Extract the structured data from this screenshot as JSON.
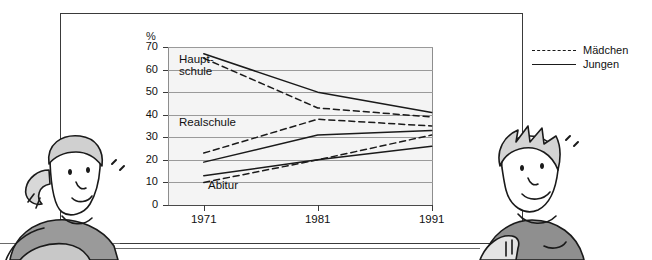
{
  "legend": {
    "items": [
      {
        "label": "Mädchen",
        "style": "dashed",
        "name": "legend-maedchen"
      },
      {
        "label": "Jungen",
        "style": "solid",
        "name": "legend-jungen"
      }
    ]
  },
  "captions": {
    "hauptschule_line1": "Haupt-",
    "hauptschule_line2": "schule",
    "realschule": "Realschule",
    "abitur": "Abitur"
  },
  "figures": {
    "girl_alt": "cartoon-girl-illustration",
    "boy_alt": "cartoon-boy-illustration"
  },
  "chart_data": {
    "type": "line",
    "title": "",
    "xlabel": "",
    "ylabel": "%",
    "unit_label": "%",
    "x": [
      1971,
      1981,
      1991
    ],
    "categories": [
      "1971",
      "1981",
      "1991"
    ],
    "xtick_labels": [
      "1971",
      "1981",
      "1991"
    ],
    "ytick_labels": [
      "0",
      "10",
      "20",
      "30",
      "40",
      "50",
      "60",
      "70"
    ],
    "yticks": [
      0,
      10,
      20,
      30,
      40,
      50,
      60,
      70
    ],
    "ylim": [
      0,
      70
    ],
    "grid": true,
    "legend_position": "outside-right",
    "annotations": [
      "Haupt-schule",
      "Realschule",
      "Abitur"
    ],
    "series": [
      {
        "name": "Hauptschule Jungen",
        "group": "Hauptschule",
        "gender": "Jungen",
        "style": "solid",
        "values": [
          67,
          50,
          41
        ]
      },
      {
        "name": "Hauptschule Mädchen",
        "group": "Hauptschule",
        "gender": "Mädchen",
        "style": "dashed",
        "values": [
          65,
          43,
          39
        ]
      },
      {
        "name": "Realschule Mädchen",
        "group": "Realschule",
        "gender": "Mädchen",
        "style": "dashed",
        "values": [
          23,
          38,
          35
        ]
      },
      {
        "name": "Realschule Jungen",
        "group": "Realschule",
        "gender": "Jungen",
        "style": "solid",
        "values": [
          19,
          31,
          33
        ]
      },
      {
        "name": "Abitur Jungen",
        "group": "Abitur",
        "gender": "Jungen",
        "style": "solid",
        "values": [
          13,
          20,
          26
        ]
      },
      {
        "name": "Abitur Mädchen",
        "group": "Abitur",
        "gender": "Mädchen",
        "style": "dashed",
        "values": [
          10,
          20,
          31
        ]
      }
    ]
  }
}
